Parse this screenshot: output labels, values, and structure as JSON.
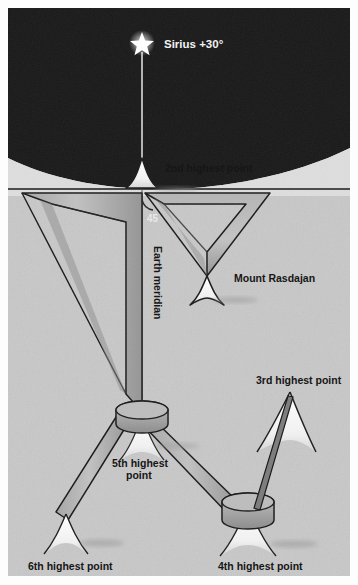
{
  "figure": {
    "background_color": "#ffffff"
  },
  "sky": {
    "color": "#191919",
    "star_icon": "star-icon",
    "star_label": "Sirius +30°"
  },
  "earth": {
    "limb_color": "#dcdcdc",
    "ground_color": "#c6c6c6",
    "meridian_label": "Earth meridian",
    "angle_label": "45"
  },
  "labels": {
    "second": "2nd highest point",
    "third": "3rd highest point",
    "fourth": "4th highest point",
    "fifth_line1": "5th highest",
    "fifth_line2": "point",
    "sixth": "6th highest point",
    "rasdajan": "Mount Rasdajan"
  },
  "colors": {
    "band_light": "#b9b9b9",
    "band_dark": "#9a9a9a",
    "ink": "#1b1b1b",
    "peak_snow": "#fafafa",
    "shadow": "#a8a8a8"
  }
}
